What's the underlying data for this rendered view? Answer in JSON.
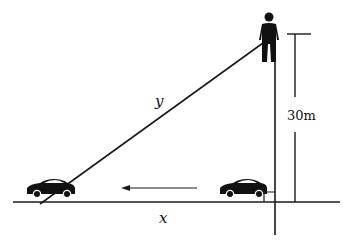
{
  "diagram": {
    "type": "related-rates right triangle",
    "labels": {
      "hypotenuse": "y",
      "horizontal": "x",
      "height": "30m"
    },
    "elements": {
      "observer": "person standing atop a tower",
      "cars": [
        "car moving away (left)",
        "car at base of tower (right)"
      ],
      "motion_arrow": "points left"
    },
    "colors": {
      "stroke": "#1a1a1a",
      "fill": "#111111",
      "background": "#ffffff"
    }
  }
}
